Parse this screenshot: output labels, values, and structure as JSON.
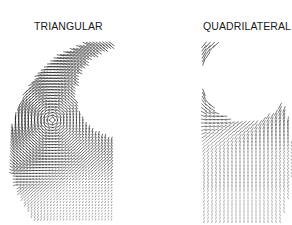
{
  "figure": {
    "panels": [
      {
        "id": "triangular",
        "label": "TRIANGULAR",
        "description": "velocity vector field on triangular mesh",
        "field": {
          "outer": {
            "cx": 118,
            "cy": 150,
            "rx": 108,
            "ry": 112
          },
          "hole": {
            "cx": 122,
            "cy": 93,
            "r": 46
          },
          "bbox": [
            6,
            38,
            114,
            222
          ],
          "vortex": {
            "cx": 52,
            "cy": 120
          },
          "spacing": 3.2,
          "color": "#1a1a1a"
        }
      },
      {
        "id": "quadrilateral",
        "label": "QUADRILATERAL",
        "description": "velocity vector field on quadrilateral mesh",
        "field": {
          "outer": {
            "cx": 205,
            "cy": 160,
            "rx": 88,
            "ry": 122
          },
          "hole": {
            "cx": 246,
            "cy": 78,
            "r": 44
          },
          "bbox": [
            200,
            38,
            292,
            222
          ],
          "fan": {
            "cx": 246,
            "cy": 78
          },
          "spacing": 4.0,
          "color": "#1a1a1a"
        }
      }
    ]
  }
}
